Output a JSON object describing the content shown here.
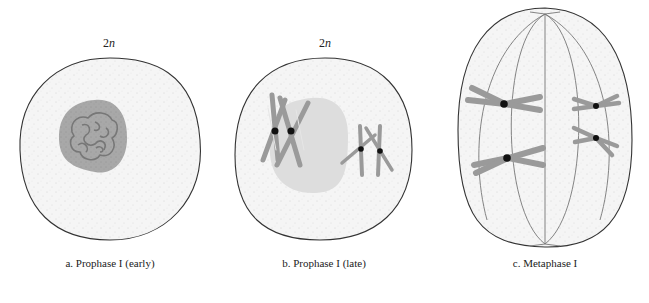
{
  "figure": {
    "panels": [
      {
        "id": "a",
        "caption": "a. Prophase I (early)",
        "ploidy_number": "2",
        "ploidy_letter": "n"
      },
      {
        "id": "b",
        "caption": "b. Prophase I (late)",
        "ploidy_number": "2",
        "ploidy_letter": "n"
      },
      {
        "id": "c",
        "caption": "c. Metaphase I"
      }
    ],
    "colors": {
      "cell_outline": "#333333",
      "cytoplasm": "#f4f4f4",
      "nucleus_early": "#a9a9a9",
      "nucleus_late": "#dcdcdc",
      "chromosome": "#9a9a9a",
      "centromere": "#111111",
      "spindle": "#777777"
    }
  }
}
